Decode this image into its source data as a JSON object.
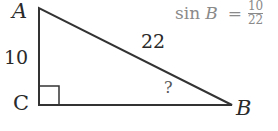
{
  "figure": {
    "vertices": {
      "A": {
        "label": "A",
        "x": 39,
        "y": 8
      },
      "B": {
        "label": "B",
        "x": 232,
        "y": 105
      },
      "C": {
        "label": "C",
        "x": 39,
        "y": 105
      }
    },
    "side_labels": {
      "AC": "10",
      "AB": "22",
      "angle_B": "?"
    },
    "right_angle_at": "C",
    "stroke_color": "#333333"
  },
  "formula": {
    "lhs": "sin",
    "var": "B",
    "equals": "=",
    "numerator": "10",
    "denominator": "22"
  }
}
